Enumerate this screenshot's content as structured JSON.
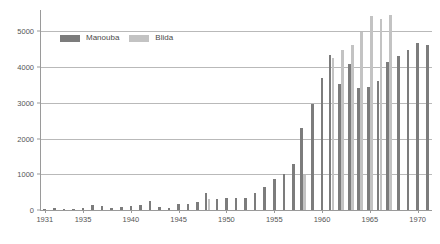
{
  "chart_data": {
    "type": "bar",
    "title": "",
    "subtitle": "",
    "xlabel": "",
    "ylabel": "",
    "xlim": [
      1930.5,
      1971.5
    ],
    "ylim": [
      0,
      5600
    ],
    "yticks": [
      0,
      1000,
      2000,
      3000,
      4000,
      5000
    ],
    "ytick_labels": [
      "0",
      "1000",
      "2000",
      "3000",
      "4000",
      "5000"
    ],
    "xticks": [
      1931,
      1935,
      1940,
      1945,
      1950,
      1955,
      1960,
      1965,
      1970
    ],
    "xtick_labels": [
      "1931",
      "1935",
      "1940",
      "1945",
      "1950",
      "1955",
      "1960",
      "1965",
      "1970"
    ],
    "grid": "horizontal",
    "legend_position": "top-left",
    "categories": [
      1931,
      1932,
      1933,
      1934,
      1935,
      1936,
      1937,
      1938,
      1939,
      1940,
      1941,
      1942,
      1943,
      1944,
      1945,
      1946,
      1947,
      1948,
      1949,
      1950,
      1951,
      1952,
      1953,
      1954,
      1955,
      1956,
      1957,
      1958,
      1959,
      1960,
      1961,
      1962,
      1963,
      1964,
      1965,
      1966,
      1967,
      1968,
      1969,
      1970,
      1971
    ],
    "series": [
      {
        "name": "Manouba",
        "color": "#7c7c7c",
        "values": [
          20,
          70,
          40,
          35,
          45,
          150,
          110,
          60,
          85,
          100,
          135,
          240,
          75,
          60,
          160,
          165,
          215,
          480,
          320,
          330,
          330,
          330,
          480,
          650,
          855,
          1000,
          1275,
          2285,
          2980,
          3710,
          4330,
          3540,
          4095,
          3420,
          3440,
          3600,
          4140,
          4310,
          4480,
          4690,
          4620
        ]
      },
      {
        "name": "Blida",
        "color": "#c3c3c3",
        "values": [
          null,
          null,
          null,
          null,
          null,
          null,
          null,
          null,
          null,
          null,
          null,
          null,
          null,
          null,
          null,
          null,
          null,
          300,
          null,
          null,
          null,
          null,
          null,
          null,
          null,
          null,
          null,
          990,
          null,
          null,
          4250,
          4490,
          4610,
          4980,
          5440,
          5340,
          5470,
          null,
          null,
          null,
          null
        ]
      }
    ]
  },
  "legend": {
    "items": [
      {
        "label": "Manouba",
        "swatch": "manouba-swatch"
      },
      {
        "label": "Blida",
        "swatch": "blida-swatch"
      }
    ]
  }
}
